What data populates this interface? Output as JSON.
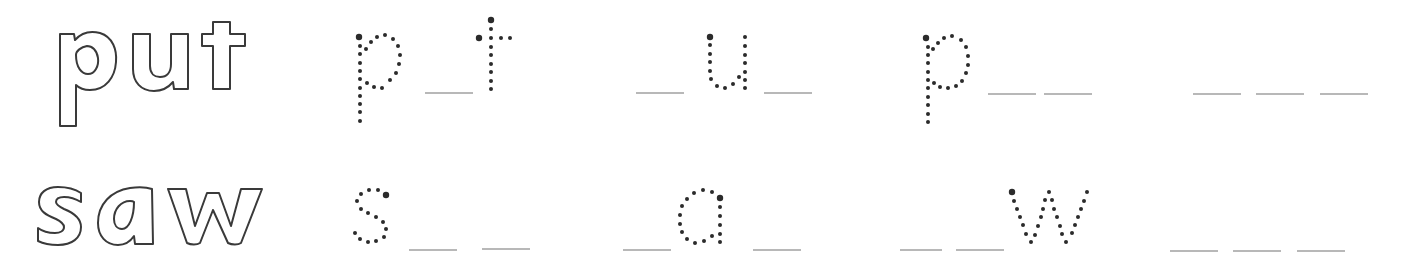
{
  "worksheet": {
    "rows": [
      {
        "word": "put",
        "exercises": [
          {
            "pattern": "p _ t",
            "given": [
              "p",
              "t"
            ],
            "blanks": 1
          },
          {
            "pattern": "_ u _",
            "given": [
              "u"
            ],
            "blanks": 2
          },
          {
            "pattern": "p _ _",
            "given": [
              "p"
            ],
            "blanks": 2
          },
          {
            "pattern": "_ _ _",
            "given": [],
            "blanks": 3
          }
        ]
      },
      {
        "word": "saw",
        "exercises": [
          {
            "pattern": "s _ _",
            "given": [
              "s"
            ],
            "blanks": 2
          },
          {
            "pattern": "_ a _",
            "given": [
              "a"
            ],
            "blanks": 2
          },
          {
            "pattern": "_ _ w",
            "given": [
              "w"
            ],
            "blanks": 2
          },
          {
            "pattern": "_ _ _",
            "given": [],
            "blanks": 3
          }
        ]
      }
    ],
    "colors": {
      "outline_stroke": "#3a3a3a",
      "dot": "#2b2b2b",
      "blank_line": "#b8b8b8",
      "background": "#ffffff"
    }
  }
}
